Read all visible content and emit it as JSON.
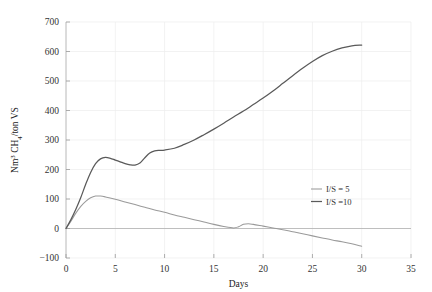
{
  "chart_data": {
    "type": "line",
    "title": "",
    "xlabel": "Days",
    "ylabel": "Nm³ CH₄/ton VS",
    "xlim": [
      0,
      35
    ],
    "ylim": [
      -100,
      700
    ],
    "xticks": [
      "0",
      "5",
      "10",
      "15",
      "20",
      "25",
      "30",
      "35"
    ],
    "yticks": [
      "-100",
      "0",
      "100",
      "200",
      "300",
      "400",
      "500",
      "600",
      "700"
    ],
    "grid": true,
    "legend_position": "right-middle",
    "series": [
      {
        "name": "I/S = 5",
        "color": "#9a9a9a",
        "x": [
          0,
          0.5,
          1,
          1.5,
          2,
          2.5,
          3,
          3.5,
          4,
          5,
          6,
          7,
          8,
          9,
          10,
          11,
          12,
          13,
          14,
          15,
          16,
          17,
          17.5,
          18,
          18.5,
          19,
          20,
          21,
          22,
          23,
          24,
          25,
          26,
          27,
          28,
          29,
          30
        ],
        "values": [
          0,
          25,
          52,
          75,
          92,
          104,
          110,
          110,
          107,
          99,
          90,
          81,
          72,
          63,
          55,
          46,
          38,
          30,
          22,
          14,
          7,
          2,
          6,
          14,
          16,
          14,
          8,
          2,
          -4,
          -11,
          -18,
          -25,
          -32,
          -39,
          -45,
          -52,
          -60
        ]
      },
      {
        "name": "I/S =10",
        "color": "#5a5a5a",
        "x": [
          0,
          0.5,
          1,
          1.5,
          2,
          2.5,
          3,
          3.5,
          4,
          4.5,
          5,
          5.5,
          6,
          6.5,
          7,
          7.5,
          8,
          8.5,
          9,
          9.5,
          10,
          11,
          12,
          13,
          14,
          15,
          16,
          17,
          18,
          19,
          20,
          21,
          22,
          23,
          24,
          25,
          26,
          27,
          28,
          29,
          30
        ],
        "values": [
          0,
          30,
          65,
          105,
          150,
          190,
          220,
          236,
          241,
          238,
          232,
          226,
          220,
          216,
          215,
          222,
          240,
          256,
          263,
          265,
          266,
          272,
          285,
          300,
          318,
          337,
          357,
          378,
          398,
          420,
          442,
          466,
          492,
          518,
          543,
          566,
          586,
          601,
          612,
          619,
          622
        ]
      }
    ]
  },
  "legend": {
    "items": [
      {
        "label": "I/S = 5"
      },
      {
        "label": "I/S =10"
      }
    ]
  },
  "axes": {
    "x_title": "Days",
    "y_title_parts": {
      "nm": "Nm",
      "nm_sup": "3",
      "ch": " CH",
      "ch_sub": "4",
      "rest": "/ton VS"
    }
  }
}
